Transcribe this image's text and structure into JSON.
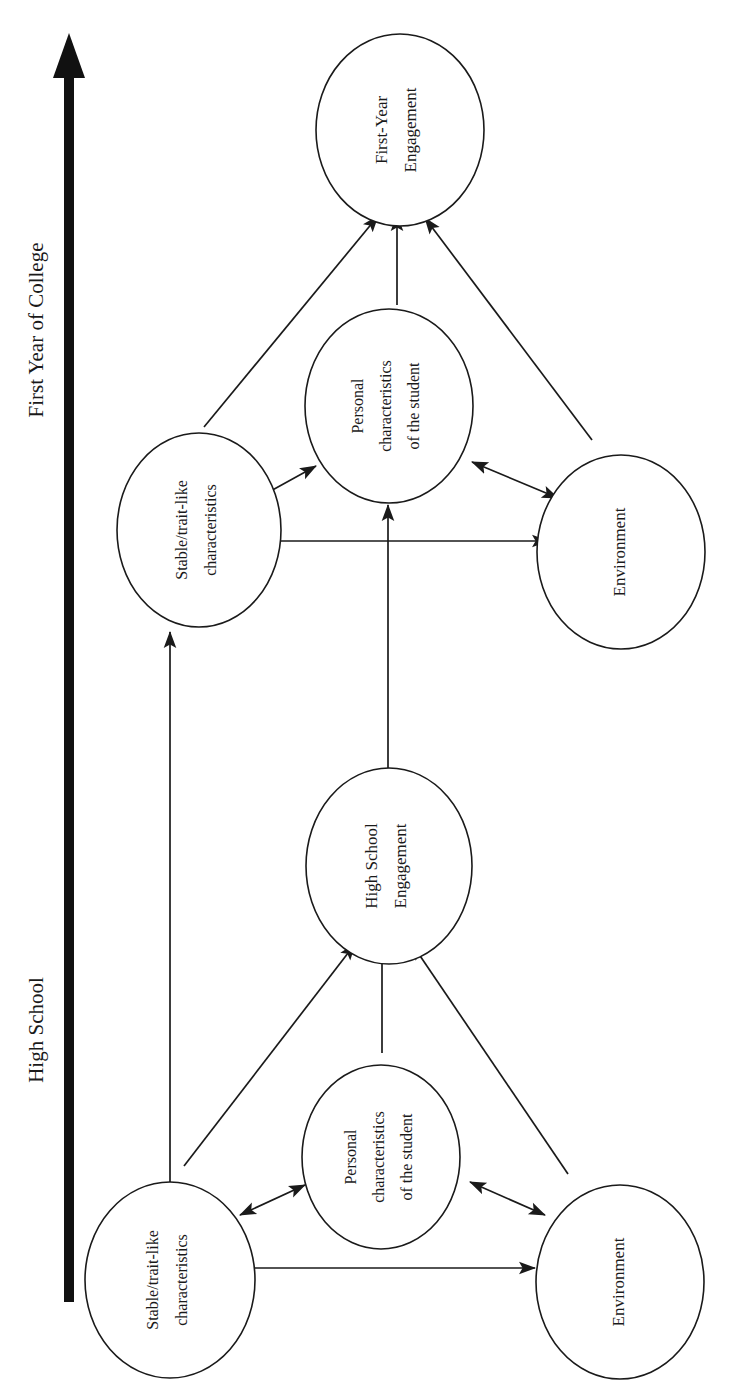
{
  "diagram": {
    "type": "conceptual-model-flow",
    "orientation": "rotated-90-ccw",
    "canvas": {
      "width": 745,
      "height": 1394
    },
    "timeline": {
      "name": "time-axis-arrow",
      "direction": "upward",
      "phases": [
        {
          "id": "high-school",
          "label": "High School"
        },
        {
          "id": "first-year-college",
          "label": "First Year of College"
        }
      ]
    },
    "nodes": [
      {
        "id": "hs-stable",
        "phase": "high-school",
        "lines": [
          "Stable/trait-like",
          "characteristics"
        ]
      },
      {
        "id": "hs-personal",
        "phase": "high-school",
        "lines": [
          "Personal",
          "characteristics",
          "of the student"
        ]
      },
      {
        "id": "hs-environment",
        "phase": "high-school",
        "lines": [
          "Environment"
        ]
      },
      {
        "id": "hs-engagement",
        "phase": "high-school",
        "lines": [
          "High School",
          "Engagement"
        ]
      },
      {
        "id": "col-stable",
        "phase": "first-year-college",
        "lines": [
          "Stable/trait-like",
          "characteristics"
        ]
      },
      {
        "id": "col-personal",
        "phase": "first-year-college",
        "lines": [
          "Personal",
          "characteristics",
          "of the student"
        ]
      },
      {
        "id": "col-environment",
        "phase": "first-year-college",
        "lines": [
          "Environment"
        ]
      },
      {
        "id": "col-engagement",
        "phase": "first-year-college",
        "lines": [
          "First-Year",
          "Engagement"
        ]
      }
    ],
    "edges": [
      {
        "from": "hs-stable",
        "to": "hs-personal",
        "arrow": "double"
      },
      {
        "from": "hs-environment",
        "to": "hs-personal",
        "arrow": "double"
      },
      {
        "from": "hs-stable",
        "to": "hs-environment",
        "arrow": "double"
      },
      {
        "from": "hs-stable",
        "to": "hs-engagement",
        "arrow": "single"
      },
      {
        "from": "hs-personal",
        "to": "hs-engagement",
        "arrow": "single"
      },
      {
        "from": "hs-environment",
        "to": "hs-engagement",
        "arrow": "single"
      },
      {
        "from": "col-stable",
        "to": "col-personal",
        "arrow": "double"
      },
      {
        "from": "col-environment",
        "to": "col-personal",
        "arrow": "double"
      },
      {
        "from": "col-stable",
        "to": "col-environment",
        "arrow": "double"
      },
      {
        "from": "col-stable",
        "to": "col-engagement",
        "arrow": "single"
      },
      {
        "from": "col-personal",
        "to": "col-engagement",
        "arrow": "single"
      },
      {
        "from": "col-environment",
        "to": "col-engagement",
        "arrow": "single"
      },
      {
        "from": "hs-stable",
        "to": "col-stable",
        "arrow": "single"
      },
      {
        "from": "hs-engagement",
        "to": "col-personal",
        "arrow": "single"
      }
    ],
    "colors": {
      "stroke": "#1a1a1a",
      "fill": "#ffffff",
      "timeline": "#111111"
    }
  }
}
